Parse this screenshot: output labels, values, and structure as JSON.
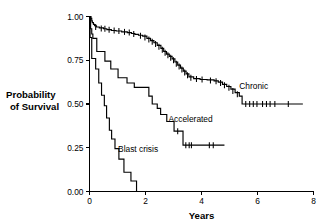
{
  "chart_data": {
    "type": "line",
    "title": "",
    "xlabel": "Years",
    "ylabel": "Probability of Survival",
    "xlim": [
      0,
      8
    ],
    "ylim": [
      0,
      1
    ],
    "grid": false,
    "legend_position": "inline-annotations",
    "xticks": [
      "0",
      "2",
      "4",
      "6",
      "8"
    ],
    "xtick_values": [
      0,
      2,
      4,
      6,
      8
    ],
    "yticks": [
      "0.00",
      "0.25",
      "0.50",
      "0.75",
      "1.00"
    ],
    "ytick_values": [
      0,
      0.25,
      0.5,
      0.75,
      1
    ],
    "series": [
      {
        "name": "Chronic",
        "label": "Chronic",
        "label_x": 5.35,
        "label_y": 0.585,
        "points": [
          [
            0.0,
            1.0
          ],
          [
            0.05,
            0.99
          ],
          [
            0.08,
            0.975
          ],
          [
            0.1,
            0.965
          ],
          [
            0.14,
            0.955
          ],
          [
            0.18,
            0.947
          ],
          [
            0.25,
            0.94
          ],
          [
            0.35,
            0.935
          ],
          [
            0.5,
            0.93
          ],
          [
            0.62,
            0.925
          ],
          [
            0.78,
            0.92
          ],
          [
            0.95,
            0.917
          ],
          [
            1.15,
            0.912
          ],
          [
            1.35,
            0.908
          ],
          [
            1.5,
            0.903
          ],
          [
            1.62,
            0.898
          ],
          [
            1.75,
            0.893
          ],
          [
            1.9,
            0.888
          ],
          [
            2.05,
            0.875
          ],
          [
            2.18,
            0.862
          ],
          [
            2.3,
            0.85
          ],
          [
            2.42,
            0.835
          ],
          [
            2.55,
            0.818
          ],
          [
            2.65,
            0.8
          ],
          [
            2.75,
            0.785
          ],
          [
            2.85,
            0.772
          ],
          [
            2.95,
            0.758
          ],
          [
            3.05,
            0.74
          ],
          [
            3.15,
            0.722
          ],
          [
            3.25,
            0.705
          ],
          [
            3.35,
            0.688
          ],
          [
            3.45,
            0.672
          ],
          [
            3.55,
            0.655
          ],
          [
            3.72,
            0.645
          ],
          [
            3.95,
            0.64
          ],
          [
            4.2,
            0.638
          ],
          [
            4.45,
            0.632
          ],
          [
            4.6,
            0.625
          ],
          [
            4.75,
            0.612
          ],
          [
            4.9,
            0.6
          ],
          [
            5.05,
            0.585
          ],
          [
            5.2,
            0.565
          ],
          [
            5.35,
            0.545
          ],
          [
            5.45,
            0.5
          ],
          [
            7.62,
            0.5
          ]
        ],
        "censor_marks": [
          [
            0.22,
            0.94
          ],
          [
            0.42,
            0.932
          ],
          [
            0.55,
            0.93
          ],
          [
            0.7,
            0.925
          ],
          [
            0.88,
            0.92
          ],
          [
            1.05,
            0.917
          ],
          [
            1.25,
            0.912
          ],
          [
            1.42,
            0.908
          ],
          [
            1.58,
            0.9
          ],
          [
            1.82,
            0.89
          ],
          [
            1.98,
            0.88
          ],
          [
            2.12,
            0.868
          ],
          [
            2.24,
            0.856
          ],
          [
            2.36,
            0.843
          ],
          [
            2.48,
            0.827
          ],
          [
            2.6,
            0.81
          ],
          [
            2.7,
            0.793
          ],
          [
            2.8,
            0.778
          ],
          [
            2.9,
            0.765
          ],
          [
            3.0,
            0.75
          ],
          [
            3.1,
            0.73
          ],
          [
            3.2,
            0.714
          ],
          [
            3.3,
            0.697
          ],
          [
            3.4,
            0.68
          ],
          [
            3.5,
            0.664
          ],
          [
            3.62,
            0.65
          ],
          [
            3.82,
            0.643
          ],
          [
            4.02,
            0.64
          ],
          [
            4.32,
            0.635
          ],
          [
            4.52,
            0.63
          ],
          [
            4.68,
            0.62
          ],
          [
            4.82,
            0.607
          ],
          [
            4.98,
            0.593
          ],
          [
            5.12,
            0.575
          ],
          [
            5.28,
            0.556
          ],
          [
            5.58,
            0.5
          ],
          [
            5.72,
            0.5
          ],
          [
            5.85,
            0.5
          ],
          [
            5.98,
            0.5
          ],
          [
            6.18,
            0.5
          ],
          [
            6.32,
            0.5
          ],
          [
            6.45,
            0.5
          ],
          [
            6.62,
            0.5
          ],
          [
            7.1,
            0.5
          ]
        ]
      },
      {
        "name": "Accelerated",
        "label": "Accelerated",
        "label_x": 2.82,
        "label_y": 0.395,
        "points": [
          [
            0.0,
            1.0
          ],
          [
            0.04,
            0.93
          ],
          [
            0.08,
            0.9
          ],
          [
            0.12,
            0.875
          ],
          [
            0.22,
            0.875
          ],
          [
            0.26,
            0.8
          ],
          [
            0.52,
            0.8
          ],
          [
            0.55,
            0.745
          ],
          [
            0.72,
            0.745
          ],
          [
            0.76,
            0.7
          ],
          [
            0.98,
            0.7
          ],
          [
            1.02,
            0.65
          ],
          [
            1.3,
            0.65
          ],
          [
            1.34,
            0.62
          ],
          [
            1.56,
            0.62
          ],
          [
            1.6,
            0.595
          ],
          [
            2.08,
            0.595
          ],
          [
            2.12,
            0.545
          ],
          [
            2.2,
            0.545
          ],
          [
            2.24,
            0.5
          ],
          [
            2.38,
            0.5
          ],
          [
            2.42,
            0.475
          ],
          [
            2.5,
            0.475
          ],
          [
            2.54,
            0.44
          ],
          [
            2.72,
            0.44
          ],
          [
            2.76,
            0.4
          ],
          [
            2.98,
            0.4
          ],
          [
            3.02,
            0.345
          ],
          [
            3.3,
            0.345
          ],
          [
            3.34,
            0.265
          ],
          [
            4.82,
            0.265
          ]
        ],
        "censor_marks": [
          [
            3.15,
            0.345
          ],
          [
            3.44,
            0.265
          ],
          [
            3.56,
            0.265
          ],
          [
            3.64,
            0.265
          ],
          [
            4.28,
            0.265
          ],
          [
            4.42,
            0.265
          ]
        ]
      },
      {
        "name": "Blast crisis",
        "label": "Blast crisis",
        "label_x": 1.02,
        "label_y": 0.225,
        "points": [
          [
            0.0,
            1.0
          ],
          [
            0.02,
            0.88
          ],
          [
            0.06,
            0.88
          ],
          [
            0.08,
            0.76
          ],
          [
            0.2,
            0.76
          ],
          [
            0.22,
            0.7
          ],
          [
            0.3,
            0.7
          ],
          [
            0.33,
            0.62
          ],
          [
            0.4,
            0.62
          ],
          [
            0.43,
            0.55
          ],
          [
            0.5,
            0.55
          ],
          [
            0.53,
            0.49
          ],
          [
            0.58,
            0.49
          ],
          [
            0.61,
            0.42
          ],
          [
            0.68,
            0.42
          ],
          [
            0.71,
            0.35
          ],
          [
            0.76,
            0.35
          ],
          [
            0.79,
            0.3
          ],
          [
            0.88,
            0.3
          ],
          [
            0.91,
            0.245
          ],
          [
            1.02,
            0.245
          ],
          [
            1.05,
            0.185
          ],
          [
            1.2,
            0.185
          ],
          [
            1.23,
            0.11
          ],
          [
            1.45,
            0.11
          ],
          [
            1.48,
            0.06
          ],
          [
            1.65,
            0.06
          ],
          [
            1.68,
            0.0
          ],
          [
            1.72,
            0.0
          ]
        ],
        "censor_marks": []
      }
    ]
  }
}
